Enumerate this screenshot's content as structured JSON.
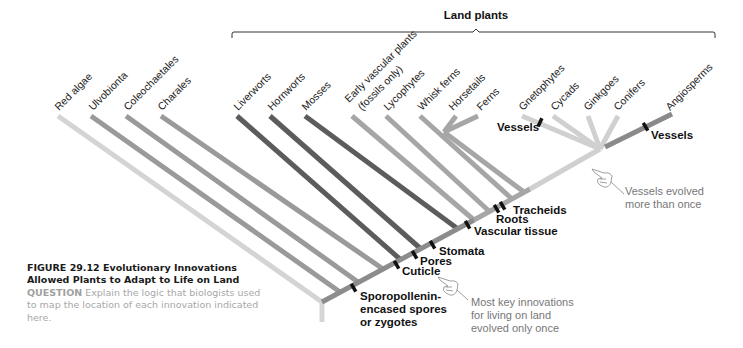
{
  "group": {
    "title": "Land plants"
  },
  "taxa": [
    {
      "label": "Red algae"
    },
    {
      "label": "Ulvobionta"
    },
    {
      "label": "Coleochaetales"
    },
    {
      "label": "Charales"
    },
    {
      "label": "Liverworts"
    },
    {
      "label": "Hornworts"
    },
    {
      "label": "Mosses"
    },
    {
      "label": "Early vascular plants",
      "label2": "(fossils only)"
    },
    {
      "label": "Lycophytes"
    },
    {
      "label": "Whisk ferns"
    },
    {
      "label": "Horsetails"
    },
    {
      "label": "Ferns"
    },
    {
      "label": "Gnetophytes"
    },
    {
      "label": "Cycads"
    },
    {
      "label": "Ginkgoes"
    },
    {
      "label": "Conifers"
    },
    {
      "label": "Angiosperms"
    }
  ],
  "innovations": [
    {
      "label": "Sporopollenin-",
      "label2": "encased spores",
      "label3": "or zygotes"
    },
    {
      "label": "Cuticle"
    },
    {
      "label": "Pores"
    },
    {
      "label": "Stomata"
    },
    {
      "label": "Vascular tissue"
    },
    {
      "label": "Roots"
    },
    {
      "label": "Tracheids"
    },
    {
      "label": "Vessels"
    },
    {
      "label": "Vessels"
    }
  ],
  "notes": {
    "vessels": {
      "line1": "Vessels evolved",
      "line2": "more than once"
    },
    "key": {
      "line1": "Most key innovations",
      "line2": "for living on land",
      "line3": "evolved only once"
    }
  },
  "caption": {
    "figure": "FIGURE 29.12  Evolutionary Innovations Allowed Plants to Adapt to Life on Land",
    "question_label": "QUESTION",
    "question_text": " Explain the logic that biologists used to map the location of each innovation indicated here."
  },
  "colors": {
    "light": "#d2d2d2",
    "mid": "#9a9a9a",
    "dark": "#5e5e5e",
    "vascular": "#a6a6a6",
    "seed": "#cfcfcf",
    "angio": "#8a8a8a",
    "trunk": "#8c8c8c",
    "marker": "#111111"
  }
}
